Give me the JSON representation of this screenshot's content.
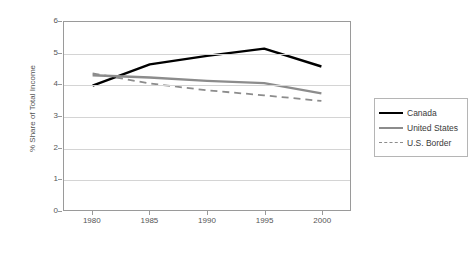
{
  "chart_data": {
    "type": "line",
    "title": "",
    "xlabel": "",
    "ylabel": "% Share of Total Income",
    "x": [
      1980,
      1985,
      1990,
      1995,
      2000
    ],
    "xtick_labels": [
      "1980",
      "1985",
      "1990",
      "1995",
      "2000"
    ],
    "xlim": [
      1977.5,
      2002.5
    ],
    "ylim": [
      0,
      6
    ],
    "ytick_labels": [
      "0",
      "1",
      "2",
      "3",
      "4",
      "5",
      "6"
    ],
    "yticks": [
      0,
      1,
      2,
      3,
      4,
      5,
      6
    ],
    "grid": "horizontal",
    "legend_position": "right",
    "series": [
      {
        "name": "Canada",
        "color": "#000000",
        "style": "solid",
        "values": [
          3.97,
          4.65,
          4.92,
          5.15,
          4.58
        ]
      },
      {
        "name": "United States",
        "color": "#8c8c8c",
        "style": "solid",
        "values": [
          4.3,
          4.23,
          4.12,
          4.05,
          3.72
        ]
      },
      {
        "name": "U.S. Border",
        "color": "#8c8c8c",
        "style": "dashed",
        "values": [
          4.36,
          4.04,
          3.82,
          3.66,
          3.48
        ]
      }
    ]
  },
  "legend": {
    "items": [
      {
        "label": "Canada"
      },
      {
        "label": "United States"
      },
      {
        "label": "U.S. Border"
      }
    ]
  }
}
